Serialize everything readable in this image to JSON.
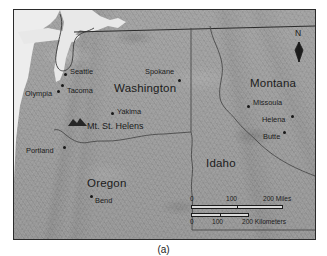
{
  "figure": {
    "caption": "(a)",
    "background_color": "#ffffff"
  },
  "map": {
    "frame_color": "#2b2b2b",
    "land_color": "#9c9c9c",
    "water_color": "#ececec",
    "label_color": "#1b1b1b",
    "region": "Pacific Northwest",
    "states": [
      {
        "name": "Washington",
        "x": 100,
        "y": 79
      },
      {
        "name": "Oregon",
        "x": 85,
        "y": 174
      },
      {
        "name": "Idaho",
        "x": 205,
        "y": 154
      },
      {
        "name": "Montana",
        "x": 249,
        "y": 74
      }
    ],
    "cities": [
      {
        "name": "Seattle",
        "label_x": 69,
        "label_y": 68,
        "dot_x": 64,
        "dot_y": 73,
        "label_side": "right"
      },
      {
        "name": "Tacoma",
        "label_x": 66,
        "label_y": 86,
        "dot_x": 61,
        "dot_y": 84,
        "label_side": "right"
      },
      {
        "name": "Olympia",
        "label_x": 25,
        "label_y": 88,
        "dot_x": 56,
        "dot_y": 89,
        "label_side": "left"
      },
      {
        "name": "Spokane",
        "label_x": 144,
        "label_y": 67,
        "dot_x": 178,
        "dot_y": 79,
        "label_side": "right"
      },
      {
        "name": "Yakima",
        "label_x": 115,
        "label_y": 107,
        "dot_x": 110,
        "dot_y": 112,
        "label_side": "right"
      },
      {
        "name": "Portland",
        "label_x": 26,
        "label_y": 144,
        "dot_x": 62,
        "dot_y": 146,
        "label_side": "left"
      },
      {
        "name": "Bend",
        "label_x": 93,
        "label_y": 195,
        "dot_x": 89,
        "dot_y": 195,
        "label_side": "right"
      },
      {
        "name": "Missoula",
        "label_x": 252,
        "label_y": 98,
        "dot_x": 247,
        "dot_y": 104,
        "label_side": "right"
      },
      {
        "name": "Helena",
        "label_x": 261,
        "label_y": 114,
        "dot_x": 290,
        "dot_y": 115,
        "label_side": "left"
      },
      {
        "name": "Butte",
        "label_x": 262,
        "label_y": 131,
        "dot_x": 283,
        "dot_y": 130,
        "label_side": "left"
      }
    ],
    "landmark": {
      "name": "Mt. St. Helens",
      "label_x": 86,
      "label_y": 122,
      "symbol_x": 67,
      "symbol_y": 121
    },
    "north_arrow": {
      "label": "N",
      "x": 295,
      "y": 29
    },
    "scale_bars": [
      {
        "unit": "Miles",
        "ticks": [
          "0",
          "100",
          "200 Miles"
        ],
        "tick_values": [
          0,
          100,
          200
        ],
        "x": 190,
        "y": 207,
        "width": 92
      },
      {
        "unit": "Kilometers",
        "ticks": [
          "0",
          "100",
          "200 Kilometers"
        ],
        "tick_values": [
          0,
          100,
          200
        ],
        "x": 190,
        "y": 217,
        "width": 58
      }
    ]
  }
}
